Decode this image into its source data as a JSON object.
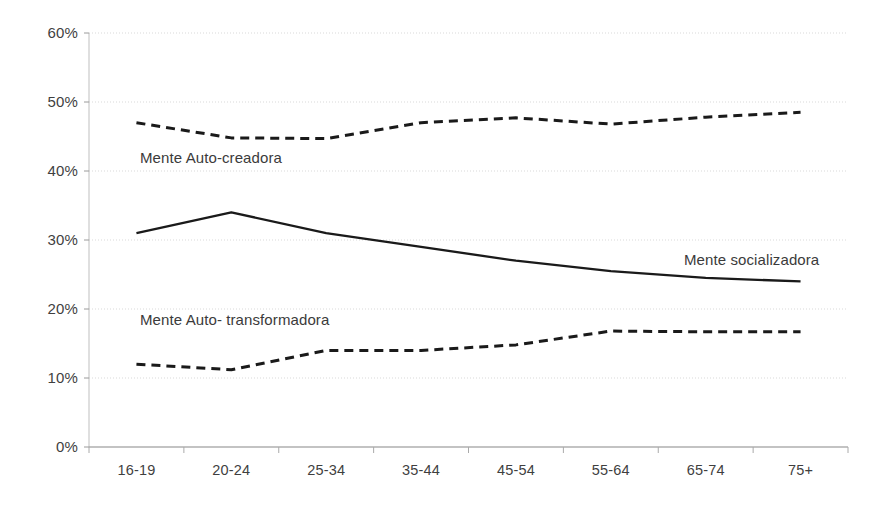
{
  "chart_data": {
    "type": "line",
    "title": "",
    "xlabel": "",
    "ylabel": "",
    "categories": [
      "16-19",
      "20-24",
      "25-34",
      "35-44",
      "45-54",
      "55-64",
      "65-74",
      "75+"
    ],
    "ylim": [
      0,
      60
    ],
    "yticks": [
      0,
      10,
      20,
      30,
      40,
      50,
      60
    ],
    "ytick_labels": [
      "0%",
      "10%",
      "20%",
      "30%",
      "40%",
      "50%",
      "60%"
    ],
    "grid": true,
    "legend_position": "inline-annotations",
    "series": [
      {
        "name": "Mente Auto-creadora",
        "style": "dashed",
        "color": "#1a1a1a",
        "values": [
          47.0,
          44.8,
          44.7,
          47.0,
          47.7,
          46.8,
          47.8,
          48.5
        ]
      },
      {
        "name": "Mente socializadora",
        "style": "solid",
        "color": "#1a1a1a",
        "values": [
          31.0,
          34.0,
          31.0,
          29.0,
          27.0,
          25.5,
          24.5,
          24.0
        ]
      },
      {
        "name": "Mente Auto- transformadora",
        "style": "dashed",
        "color": "#1a1a1a",
        "values": [
          12.0,
          11.2,
          14.0,
          14.0,
          14.8,
          16.8,
          16.7,
          16.7
        ]
      }
    ],
    "annotations": [
      {
        "text": "Mente Auto-creadora",
        "x_px": 140,
        "y_px": 150
      },
      {
        "text": "Mente socializadora",
        "x_px": 684,
        "y_px": 252
      },
      {
        "text": "Mente Auto- transformadora",
        "x_px": 140,
        "y_px": 312
      }
    ]
  },
  "axis": {
    "y_labels": [
      "60%",
      "50%",
      "40%",
      "30%",
      "20%",
      "10%",
      "0%"
    ],
    "x_labels": [
      "16-19",
      "20-24",
      "25-34",
      "35-44",
      "45-54",
      "55-64",
      "65-74",
      "75+"
    ]
  },
  "colors": {
    "line": "#1a1a1a",
    "grid": "#d9d9d9",
    "axis": "#bfbfbf",
    "text": "#3f3f3f",
    "background": "#ffffff"
  }
}
